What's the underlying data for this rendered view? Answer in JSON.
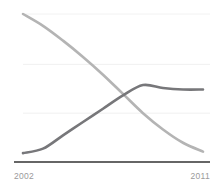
{
  "chart_data": {
    "type": "line",
    "title": "",
    "subtitle": "",
    "xlabel": "",
    "ylabel": "",
    "x": [
      2002,
      2003,
      2004,
      2005,
      2006,
      2007,
      2008,
      2009,
      2010,
      2011
    ],
    "xlim": [
      2002,
      2011
    ],
    "ylim": [
      0,
      100
    ],
    "grid": true,
    "gridlines_y": [
      33,
      66,
      100
    ],
    "legend": "none",
    "legend_entries": [],
    "annotations": [],
    "series": [
      {
        "name": "declining-series",
        "color": "#b4b4b4",
        "values": [
          100,
          92,
          82,
          71,
          59,
          46,
          33,
          22,
          13,
          7
        ]
      },
      {
        "name": "rising-series",
        "color": "#77777a",
        "values": [
          6,
          9,
          18,
          27,
          36,
          45,
          52,
          50,
          49,
          49
        ]
      }
    ],
    "axis": {
      "baseline_color": "#333333",
      "gridline_color": "#f2f2f2",
      "tick_label_color": "#9a9a9a"
    },
    "ticks": {
      "x_start_label": "2002",
      "x_end_label": "2011"
    }
  }
}
